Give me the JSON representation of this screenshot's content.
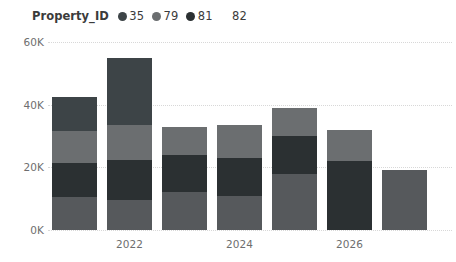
{
  "legend": {
    "title": "Property_ID",
    "items": [
      {
        "label": "35",
        "color": "#56595c"
      },
      {
        "label": "79",
        "color": "#3d4447"
      },
      {
        "label": "81",
        "color": "#6b6e70"
      },
      {
        "label": "82",
        "color": "#2b3032"
      }
    ]
  },
  "axes": {
    "y_ticks": [
      "0K",
      "20K",
      "40K",
      "60K"
    ],
    "x_ticks": [
      "2022",
      "2024",
      "2026"
    ]
  },
  "chart_data": {
    "type": "bar",
    "title": "Property_ID",
    "subtitle": "",
    "xlabel": "",
    "ylabel": "",
    "stacked": true,
    "orientation": "vertical",
    "grid": true,
    "legend_position": "top-left",
    "ylim": [
      0,
      60000
    ],
    "ytick_values": [
      0,
      20000,
      40000,
      60000
    ],
    "ytick_labels": [
      "0K",
      "20K",
      "40K",
      "60K"
    ],
    "categories": [
      "2021",
      "2022",
      "2023",
      "2024",
      "2025",
      "2026",
      "2027"
    ],
    "xtick_labels": [
      "",
      "2022",
      "",
      "2024",
      "",
      "2026",
      ""
    ],
    "series": [
      {
        "name": "35",
        "color": "#56595c",
        "values": [
          10500,
          9500,
          12000,
          11000,
          18000,
          0,
          19000
        ]
      },
      {
        "name": "82",
        "color": "#2b3032",
        "values": [
          11000,
          13000,
          12000,
          12000,
          12000,
          22000,
          0
        ]
      },
      {
        "name": "81",
        "color": "#6b6e70",
        "values": [
          10000,
          11000,
          9000,
          10500,
          9000,
          10000,
          0
        ]
      },
      {
        "name": "79",
        "color": "#3d4447",
        "values": [
          11000,
          21500,
          0,
          0,
          0,
          0,
          0
        ]
      }
    ],
    "stack_order_bottom_to_top": [
      "35",
      "82",
      "81",
      "79"
    ],
    "totals": [
      42500,
      55000,
      33000,
      33500,
      39000,
      32000,
      19000
    ]
  },
  "colors": {
    "background": "#ffffff",
    "gridline": "#d8d8d8",
    "tick_text": "#6e6e6e",
    "legend_text": "#3b3b3b"
  }
}
